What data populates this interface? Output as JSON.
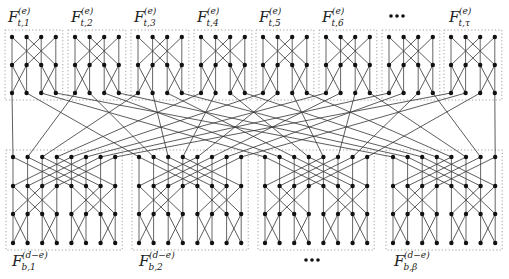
{
  "diagram": {
    "type": "butterfly-network-decomposition",
    "top_layer": {
      "block_count_shown": 8,
      "nodes_per_row": 4,
      "rows": 3,
      "row_strides": [
        2,
        1
      ],
      "labels": [
        {
          "base": "F",
          "sub": "t,1",
          "sup": "(e)"
        },
        {
          "base": "F",
          "sub": "t,2",
          "sup": "(e)"
        },
        {
          "base": "F",
          "sub": "t,3",
          "sup": "(e)"
        },
        {
          "base": "F",
          "sub": "t,4",
          "sup": "(e)"
        },
        {
          "base": "F",
          "sub": "t,5",
          "sup": "(e)"
        },
        {
          "base": "F",
          "sub": "t,6",
          "sup": "(e)"
        },
        {
          "ellipsis": "•••"
        },
        {
          "base": "F",
          "sub": "t,τ",
          "sup": "(e)"
        }
      ]
    },
    "bottom_layer": {
      "block_count_shown": 4,
      "nodes_per_row": 8,
      "rows": 4,
      "row_strides": [
        4,
        2,
        1
      ],
      "labels": [
        {
          "base": "F",
          "sub": "b,1",
          "sup": "(d−e)"
        },
        {
          "base": "F",
          "sub": "b,2",
          "sup": "(d−e)"
        },
        {
          "ellipsis": "•••"
        },
        {
          "base": "F",
          "sub": "b,β",
          "sup": "(d−e)"
        }
      ]
    },
    "interconnect": "transpose: top block b, node j → bottom block j, node b"
  }
}
